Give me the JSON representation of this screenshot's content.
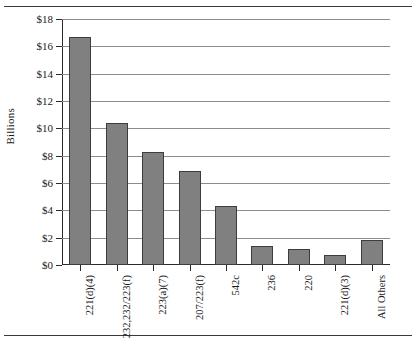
{
  "chart_data": {
    "type": "bar",
    "title": "",
    "xlabel": "",
    "ylabel": "Billions",
    "ylim": [
      0,
      18
    ],
    "ytick_step": 2,
    "grid": true,
    "legend": "none",
    "ytick_labels": [
      "$18",
      "$16",
      "$14",
      "$12",
      "$10",
      "$8",
      "$6",
      "$4",
      "$2",
      "$0"
    ],
    "ytick_values": [
      18,
      16,
      14,
      12,
      10,
      8,
      6,
      4,
      2,
      0
    ],
    "categories": [
      "221(d)(4)",
      "232,232/223(f)",
      "223(a)(7)",
      "207/223(f)",
      "542c",
      "236",
      "220",
      "221(d)(3)",
      "All Others"
    ],
    "values": [
      16.7,
      10.4,
      8.3,
      6.85,
      4.35,
      1.4,
      1.15,
      0.75,
      1.85
    ],
    "value_unit": "Billions of dollars",
    "bar_color": "#808080",
    "bar_border_color": "#3d3d3d",
    "grid_color": "#8c8c8c",
    "axis_color": "#2b2b2b"
  }
}
